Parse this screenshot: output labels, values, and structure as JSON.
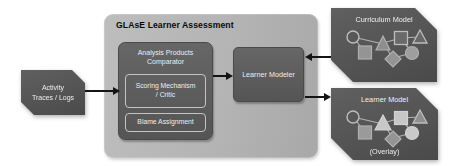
{
  "assessment": {
    "title": "GLAsE Learner Assessment"
  },
  "activity_traces": {
    "line1": "Activity",
    "line2": "Traces / Logs"
  },
  "analysis_comparator": {
    "title_line1": "Analysis Products",
    "title_line2": "Comparator"
  },
  "scoring_mechanism": {
    "line1": "Scoring Mechanism",
    "line2": "/ Critic"
  },
  "blame_assignment": {
    "label": "Blame Assignment"
  },
  "learner_modeler": {
    "label": "Learner Modeler"
  },
  "curriculum_model": {
    "label": "Curriculum Model"
  },
  "learner_model": {
    "label": "Learner Model",
    "sublabel": "(Overlay)"
  },
  "colors": {
    "canvas_bg": "#ffffff",
    "container_bg": "#b4b4b4",
    "dark_box": "#5c5c5c",
    "side_shape": "#515151",
    "box_text": "#ededed",
    "title_text": "#0a0a0a",
    "arrow": "#141414",
    "subbox_border": "#c4c4c4",
    "node_stroke": "#bdbdbd",
    "node_dim_fill": "#949494",
    "node_bright_fill": "#c7c7c7"
  }
}
